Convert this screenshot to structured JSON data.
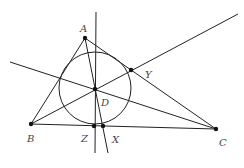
{
  "diagram": {
    "type": "triangle-geometry",
    "points": {
      "A": {
        "label": "A",
        "x": 85,
        "y": 38
      },
      "B": {
        "label": "B",
        "x": 31,
        "y": 124
      },
      "C": {
        "label": "C",
        "x": 216,
        "y": 129
      },
      "D": {
        "label": "D",
        "x": 95,
        "y": 89
      },
      "Y": {
        "label": "Y",
        "x": 131,
        "y": 70
      },
      "Z": {
        "label": "Z",
        "x": 94,
        "y": 126
      },
      "X": {
        "label": "X",
        "x": 103,
        "y": 126
      }
    },
    "circle": {
      "cx": 95,
      "cy": 88,
      "r": 36
    },
    "colors": {
      "stroke": "#222222",
      "label": "#444444"
    }
  }
}
